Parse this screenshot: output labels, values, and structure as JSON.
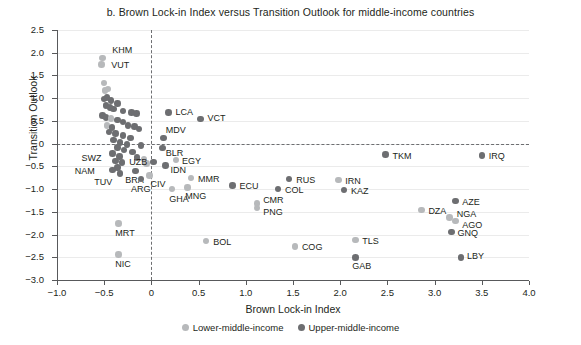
{
  "chart_data": {
    "type": "scatter",
    "title": "b. Brown Lock-in Index versus Transition Outlook for middle-income countries",
    "xlabel": "Brown Lock-in Index",
    "ylabel": "Transition Outlook",
    "xlim": [
      -1.0,
      4.0
    ],
    "ylim": [
      -3.0,
      2.5
    ],
    "xticks": [
      "-1.0",
      "-0.5",
      "0",
      "0.5",
      "1.0",
      "1.5",
      "2.0",
      "2.5",
      "3.0",
      "3.5",
      "4.0"
    ],
    "xtick_values": [
      -1.0,
      -0.5,
      0,
      0.5,
      1.0,
      1.5,
      2.0,
      2.5,
      3.0,
      3.5,
      4.0
    ],
    "yticks": [
      "2.5",
      "2.0",
      "1.5",
      "1.0",
      "0.5",
      "0",
      "-0.5",
      "-1.0",
      "-1.5",
      "-2.0",
      "-2.5",
      "-3.0"
    ],
    "ytick_values": [
      2.5,
      2.0,
      1.5,
      1.0,
      0.5,
      0,
      -0.5,
      -1.0,
      -1.5,
      -2.0,
      -2.5,
      -3.0
    ],
    "grid": true,
    "reference_lines": {
      "vertical_x": 0,
      "horizontal_y": 0
    },
    "legend_position": "bottom-center",
    "colors": {
      "lower_middle_income": "#b7b9bb",
      "upper_middle_income": "#6d6e71"
    },
    "series": [
      {
        "name": "Lower-middle-income",
        "color": "#b7b9bb"
      },
      {
        "name": "Upper-middle-income",
        "color": "#6d6e71"
      }
    ],
    "points": [
      {
        "label": "KHM",
        "x": -0.52,
        "y": 1.88,
        "group": "lower",
        "lx": 10,
        "ly": -11
      },
      {
        "label": "VUT",
        "x": -0.53,
        "y": 1.74,
        "group": "lower",
        "lx": 10,
        "ly": -3
      },
      {
        "label": "",
        "x": -0.5,
        "y": 1.33,
        "group": "lower"
      },
      {
        "label": "",
        "x": -0.46,
        "y": 1.2,
        "group": "lower"
      },
      {
        "label": "",
        "x": -0.49,
        "y": 1.17,
        "group": "lower"
      },
      {
        "label": "",
        "x": -0.47,
        "y": 1.02,
        "group": "upper"
      },
      {
        "label": "",
        "x": -0.5,
        "y": 0.98,
        "group": "upper"
      },
      {
        "label": "",
        "x": -0.43,
        "y": 0.95,
        "group": "upper"
      },
      {
        "label": "",
        "x": -0.36,
        "y": 0.88,
        "group": "upper"
      },
      {
        "label": "",
        "x": -0.48,
        "y": 0.84,
        "group": "upper"
      },
      {
        "label": "",
        "x": -0.44,
        "y": 0.8,
        "group": "upper"
      },
      {
        "label": "",
        "x": -0.4,
        "y": 0.76,
        "group": "upper"
      },
      {
        "label": "",
        "x": -0.3,
        "y": 0.72,
        "group": "upper"
      },
      {
        "label": "",
        "x": -0.21,
        "y": 0.68,
        "group": "upper"
      },
      {
        "label": "",
        "x": -0.16,
        "y": 0.66,
        "group": "upper"
      },
      {
        "label": "",
        "x": -0.52,
        "y": 0.62,
        "group": "upper"
      },
      {
        "label": "",
        "x": -0.48,
        "y": 0.58,
        "group": "upper"
      },
      {
        "label": "",
        "x": -0.43,
        "y": 0.55,
        "group": "lower"
      },
      {
        "label": "",
        "x": -0.36,
        "y": 0.52,
        "group": "upper"
      },
      {
        "label": "",
        "x": -0.3,
        "y": 0.48,
        "group": "upper"
      },
      {
        "label": "",
        "x": -0.25,
        "y": 0.4,
        "group": "upper"
      },
      {
        "label": "",
        "x": -0.47,
        "y": 0.4,
        "group": "lower"
      },
      {
        "label": "",
        "x": -0.42,
        "y": 0.36,
        "group": "upper"
      },
      {
        "label": "",
        "x": -0.18,
        "y": 0.38,
        "group": "upper"
      },
      {
        "label": "",
        "x": -0.13,
        "y": 0.32,
        "group": "upper"
      },
      {
        "label": "",
        "x": -0.45,
        "y": 0.26,
        "group": "upper"
      },
      {
        "label": "",
        "x": -0.38,
        "y": 0.22,
        "group": "upper"
      },
      {
        "label": "",
        "x": -0.3,
        "y": 0.18,
        "group": "upper"
      },
      {
        "label": "",
        "x": -0.22,
        "y": 0.12,
        "group": "upper"
      },
      {
        "label": "",
        "x": -0.4,
        "y": 0.08,
        "group": "upper"
      },
      {
        "label": "",
        "x": -0.33,
        "y": 0.02,
        "group": "upper"
      },
      {
        "label": "",
        "x": -0.26,
        "y": -0.02,
        "group": "upper"
      },
      {
        "label": "",
        "x": -0.11,
        "y": -0.04,
        "group": "upper"
      },
      {
        "label": "",
        "x": -0.36,
        "y": -0.08,
        "group": "upper"
      },
      {
        "label": "",
        "x": -0.29,
        "y": -0.14,
        "group": "upper"
      },
      {
        "label": "",
        "x": -0.2,
        "y": -0.18,
        "group": "upper"
      },
      {
        "label": "",
        "x": -0.41,
        "y": -0.22,
        "group": "upper"
      },
      {
        "label": "",
        "x": -0.34,
        "y": -0.28,
        "group": "upper"
      },
      {
        "label": "",
        "x": -0.15,
        "y": -0.3,
        "group": "upper"
      },
      {
        "label": "",
        "x": -0.08,
        "y": -0.34,
        "group": "lower"
      },
      {
        "label": "",
        "x": -0.38,
        "y": -0.38,
        "group": "upper"
      },
      {
        "label": "",
        "x": -0.31,
        "y": -0.42,
        "group": "upper"
      },
      {
        "label": "",
        "x": -0.05,
        "y": -0.44,
        "group": "lower"
      },
      {
        "label": "SWZ",
        "x": -0.36,
        "y": -0.52,
        "group": "upper",
        "lx": -36,
        "ly": -12
      },
      {
        "label": "NAM",
        "x": -0.41,
        "y": -0.58,
        "group": "upper",
        "lx": -38,
        "ly": -2
      },
      {
        "label": "TUV",
        "x": -0.33,
        "y": -0.66,
        "group": "upper",
        "lx": -26,
        "ly": 5
      },
      {
        "label": "BRA",
        "x": -0.17,
        "y": -0.6,
        "group": "upper",
        "lx": -10,
        "ly": 6
      },
      {
        "label": "ARG",
        "x": -0.11,
        "y": -0.78,
        "group": "upper",
        "lx": -10,
        "ly": 7
      },
      {
        "label": "CIV",
        "x": -0.02,
        "y": -0.7,
        "group": "lower",
        "lx": 1,
        "ly": 6
      },
      {
        "label": "LCA",
        "x": 0.18,
        "y": 0.68,
        "group": "upper",
        "lx": 7,
        "ly": -4
      },
      {
        "label": "VCT",
        "x": 0.52,
        "y": 0.54,
        "group": "upper",
        "lx": 7,
        "ly": -4
      },
      {
        "label": "MDV",
        "x": 0.13,
        "y": 0.12,
        "group": "upper",
        "lx": 2,
        "ly": -11
      },
      {
        "label": "BLR",
        "x": 0.12,
        "y": -0.1,
        "group": "upper",
        "lx": 3,
        "ly": 2
      },
      {
        "label": "UZB",
        "x": 0.02,
        "y": -0.4,
        "group": "upper",
        "lx": -24,
        "ly": -3
      },
      {
        "label": "EGY",
        "x": 0.26,
        "y": -0.36,
        "group": "lower",
        "lx": 6,
        "ly": -2
      },
      {
        "label": "IDN",
        "x": 0.15,
        "y": -0.48,
        "group": "upper",
        "lx": 5,
        "ly": 2
      },
      {
        "label": "MMR",
        "x": 0.42,
        "y": -0.76,
        "group": "lower",
        "lx": 7,
        "ly": -2
      },
      {
        "label": "MNG",
        "x": 0.38,
        "y": -0.96,
        "group": "lower",
        "lx": -2,
        "ly": 6
      },
      {
        "label": "GHA",
        "x": 0.22,
        "y": -1.0,
        "group": "lower",
        "lx": -3,
        "ly": 7
      },
      {
        "label": "ECU",
        "x": 0.86,
        "y": -0.92,
        "group": "upper",
        "lx": 7,
        "ly": -2
      },
      {
        "label": "BOL",
        "x": 0.58,
        "y": -2.14,
        "group": "lower",
        "lx": 7,
        "ly": -2
      },
      {
        "label": "RUS",
        "x": 1.46,
        "y": -0.78,
        "group": "upper",
        "lx": 7,
        "ly": -2
      },
      {
        "label": "COL",
        "x": 1.34,
        "y": -1.0,
        "group": "upper",
        "lx": 7,
        "ly": -2
      },
      {
        "label": "CMR",
        "x": 1.12,
        "y": -1.32,
        "group": "lower",
        "lx": 6,
        "ly": -7
      },
      {
        "label": "PNG",
        "x": 1.12,
        "y": -1.42,
        "group": "lower",
        "lx": 6,
        "ly": 1
      },
      {
        "label": "COG",
        "x": 1.52,
        "y": -2.26,
        "group": "lower",
        "lx": 7,
        "ly": -2
      },
      {
        "label": "IRN",
        "x": 1.98,
        "y": -0.8,
        "group": "lower",
        "lx": 7,
        "ly": -2
      },
      {
        "label": "KAZ",
        "x": 2.04,
        "y": -1.02,
        "group": "upper",
        "lx": 7,
        "ly": -2
      },
      {
        "label": "TLS",
        "x": 2.16,
        "y": -2.12,
        "group": "lower",
        "lx": 7,
        "ly": -2
      },
      {
        "label": "GAB",
        "x": 2.16,
        "y": -2.5,
        "group": "upper",
        "lx": -3,
        "ly": 6
      },
      {
        "label": "TKM",
        "x": 2.48,
        "y": -0.24,
        "group": "upper",
        "lx": 7,
        "ly": -2
      },
      {
        "label": "DZA",
        "x": 2.86,
        "y": -1.46,
        "group": "lower",
        "lx": 7,
        "ly": -2
      },
      {
        "label": "AZE",
        "x": 3.22,
        "y": -1.26,
        "group": "upper",
        "lx": 7,
        "ly": -2
      },
      {
        "label": "NGA",
        "x": 3.16,
        "y": -1.62,
        "group": "lower",
        "lx": 7,
        "ly": -6
      },
      {
        "label": "AGO",
        "x": 3.22,
        "y": -1.7,
        "group": "lower",
        "lx": 7,
        "ly": 1
      },
      {
        "label": "GNQ",
        "x": 3.18,
        "y": -1.94,
        "group": "upper",
        "lx": 6,
        "ly": -2
      },
      {
        "label": "IRQ",
        "x": 3.5,
        "y": -0.26,
        "group": "upper",
        "lx": 7,
        "ly": -2
      },
      {
        "label": "LBY",
        "x": 3.28,
        "y": -2.5,
        "group": "upper",
        "lx": 6,
        "ly": -4
      },
      {
        "label": "MRT",
        "x": -0.35,
        "y": -1.76,
        "group": "lower",
        "lx": -3,
        "ly": 6
      },
      {
        "label": "NIC",
        "x": -0.35,
        "y": -2.44,
        "group": "lower",
        "lx": -3,
        "ly": 6
      }
    ]
  },
  "legend": {
    "items": [
      {
        "label": "Lower-middle-income",
        "color": "#b7b9bb"
      },
      {
        "label": "Upper-middle-income",
        "color": "#6d6e71"
      }
    ]
  }
}
